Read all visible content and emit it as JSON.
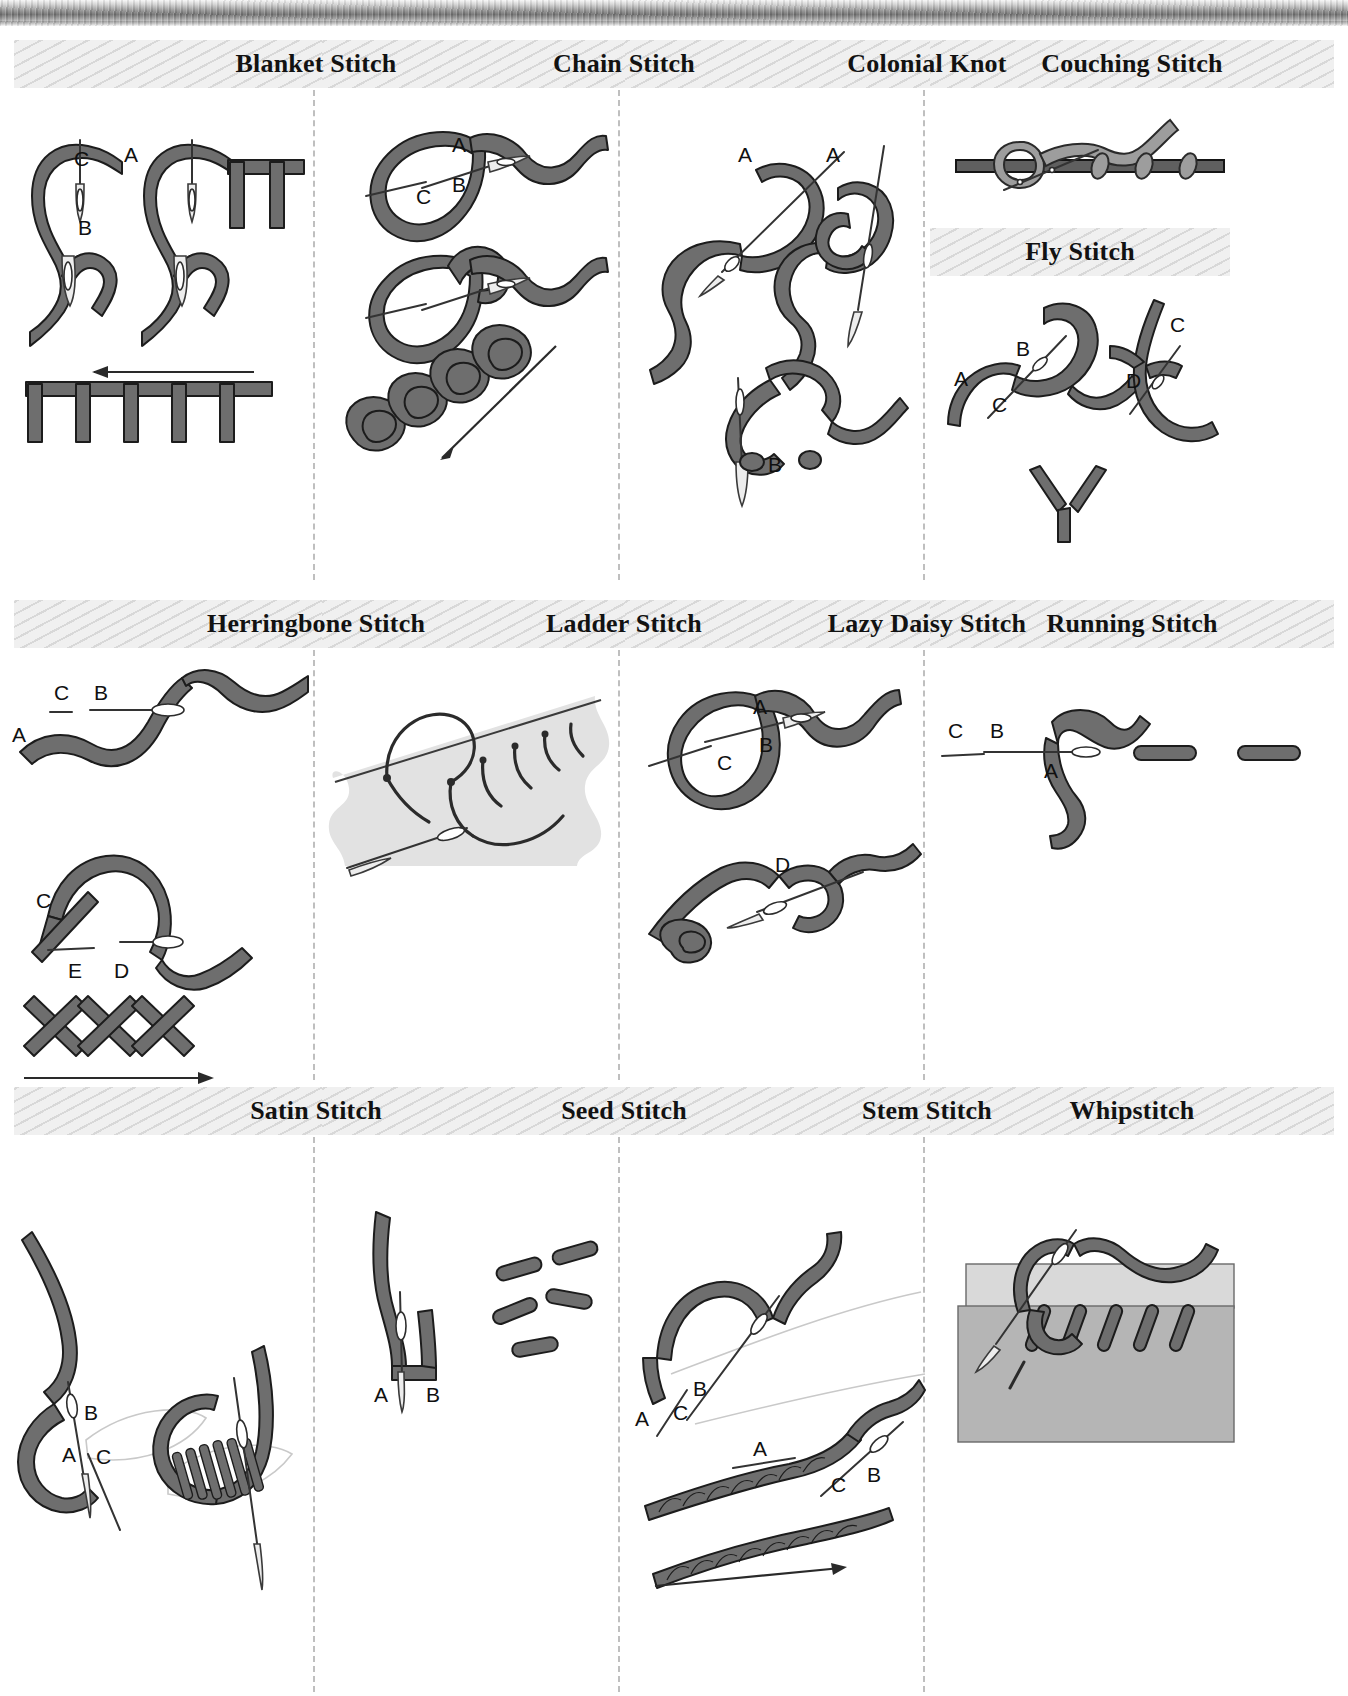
{
  "page": {
    "background_color": "#ffffff",
    "width": 1348,
    "height": 1696
  },
  "colors": {
    "band_background": "#f0f0f0",
    "band_stripe": "#d2d2d2",
    "thread_fill": "#6e6e6e",
    "thread_outline": "#1c1c1c",
    "thread_light": "#9d9d9d",
    "fabric_light": "#e2e2e2",
    "fabric_medium": "#b5b5b5",
    "separator": "#bfbfbf",
    "label_text": "#101010",
    "title_text": "#121212"
  },
  "rows": [
    {
      "row_index": 1,
      "cells": [
        {
          "title": "Blanket Stitch",
          "labels": [
            "C",
            "A",
            "B"
          ],
          "has_direction_arrow": true,
          "arrow_direction": "left"
        },
        {
          "title": "Chain Stitch",
          "labels": [
            "A",
            "B",
            "C"
          ],
          "has_direction_arrow": true,
          "arrow_direction": "down-left"
        },
        {
          "title": "Colonial Knot",
          "labels": [
            "A",
            "A",
            "B"
          ],
          "has_direction_arrow": false,
          "arrow_direction": ""
        },
        {
          "title": "Couching Stitch",
          "labels": [],
          "has_direction_arrow": false,
          "arrow_direction": "",
          "second_title": "Fly Stitch",
          "second_labels": [
            "A",
            "B",
            "C",
            "C",
            "D"
          ]
        }
      ]
    },
    {
      "row_index": 2,
      "cells": [
        {
          "title": "Herringbone Stitch",
          "labels": [
            "C",
            "B",
            "A",
            "C",
            "E",
            "D"
          ],
          "has_direction_arrow": true,
          "arrow_direction": "right"
        },
        {
          "title": "Ladder Stitch",
          "labels": [],
          "has_direction_arrow": false,
          "arrow_direction": ""
        },
        {
          "title": "Lazy Daisy Stitch",
          "labels": [
            "A",
            "B",
            "C",
            "D"
          ],
          "has_direction_arrow": false,
          "arrow_direction": ""
        },
        {
          "title": "Running Stitch",
          "labels": [
            "C",
            "B",
            "A"
          ],
          "has_direction_arrow": false,
          "arrow_direction": ""
        }
      ]
    },
    {
      "row_index": 3,
      "cells": [
        {
          "title": "Satin Stitch",
          "labels": [
            "B",
            "A",
            "C"
          ],
          "has_direction_arrow": false,
          "arrow_direction": ""
        },
        {
          "title": "Seed Stitch",
          "labels": [
            "A",
            "B"
          ],
          "has_direction_arrow": false,
          "arrow_direction": ""
        },
        {
          "title": "Stem Stitch",
          "labels": [
            "B",
            "A",
            "C",
            "A",
            "C",
            "B"
          ],
          "has_direction_arrow": true,
          "arrow_direction": "right"
        },
        {
          "title": "Whipstitch",
          "labels": [],
          "has_direction_arrow": false,
          "arrow_direction": ""
        }
      ]
    }
  ],
  "labels": {
    "A": "A",
    "B": "B",
    "C": "C",
    "D": "D",
    "E": "E"
  }
}
